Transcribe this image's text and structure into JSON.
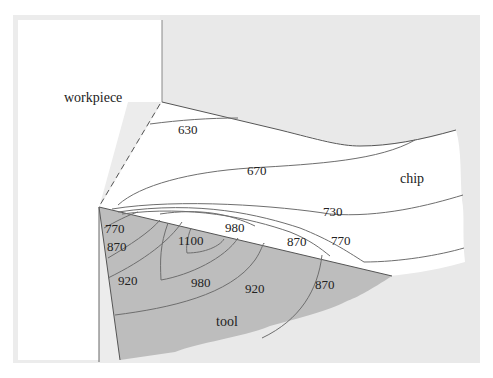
{
  "diagram": {
    "type": "temperature-distribution-cutting-zone",
    "units_implied": "degrees",
    "colors": {
      "background_frame": "#ececec",
      "workpiece": "#ffffff",
      "chip": "#ffffff",
      "tool": "#bdbdbd",
      "contour_line": "#6e6e6e",
      "text": "#222222"
    },
    "regions": {
      "workpiece": "workpiece",
      "chip": "chip",
      "tool": "tool"
    },
    "isotherms": {
      "chip": [
        {
          "value": "630"
        },
        {
          "value": "670"
        },
        {
          "value": "730"
        },
        {
          "value": "770"
        },
        {
          "value": "870"
        },
        {
          "value": "980"
        }
      ],
      "tool": [
        {
          "value": "770"
        },
        {
          "value": "870"
        },
        {
          "value": "920"
        },
        {
          "value": "1100"
        },
        {
          "value": "980"
        },
        {
          "value": "920"
        },
        {
          "value": "870"
        }
      ]
    }
  }
}
